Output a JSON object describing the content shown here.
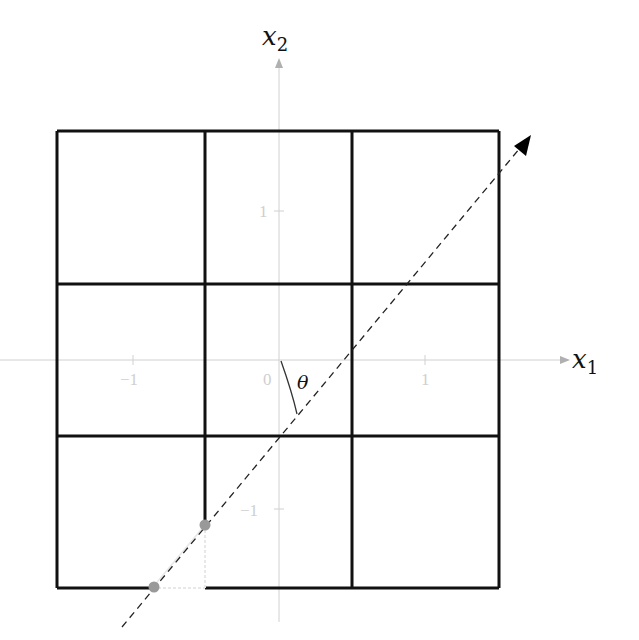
{
  "axes": {
    "x_label": "x",
    "x_sub": "1",
    "y_label": "x",
    "y_sub": "2",
    "x_ticks": [
      "−1",
      "0",
      "1"
    ],
    "y_ticks": [
      "1",
      "−1"
    ],
    "axis_color": "#c8c8c8"
  },
  "angle_label": "θ",
  "grid": {
    "cells": "3x3",
    "line_color": "#111111"
  },
  "points": {
    "color": "#999999",
    "count": 2
  },
  "direction_line": {
    "style": "dashed",
    "color": "#222222"
  }
}
